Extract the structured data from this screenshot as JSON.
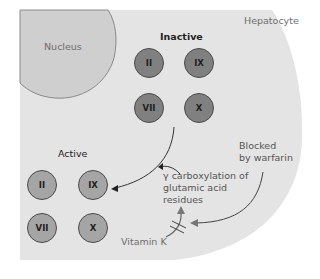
{
  "cell": {
    "label": "Hepatocyte"
  },
  "nucleus": {
    "label": "Nucleus"
  },
  "inactive_group": {
    "title": "Inactive",
    "factors": [
      "II",
      "IX",
      "VII",
      "X"
    ]
  },
  "active_group": {
    "title": "Active",
    "factors": [
      "II",
      "IX",
      "VII",
      "X"
    ]
  },
  "process": {
    "line1": "γ carboxylation of",
    "line2": "glutamic acid",
    "line3": "residues"
  },
  "cofactor": {
    "label": "Vitamin K"
  },
  "inhibitor": {
    "line1": "Blocked",
    "line2": "by warfarin"
  },
  "colors": {
    "cell_fill": "#e4e4e4",
    "nucleus_fill": "#cfcfcf",
    "inactive_factor": "#808080",
    "active_factor": "#a5a5a5"
  }
}
